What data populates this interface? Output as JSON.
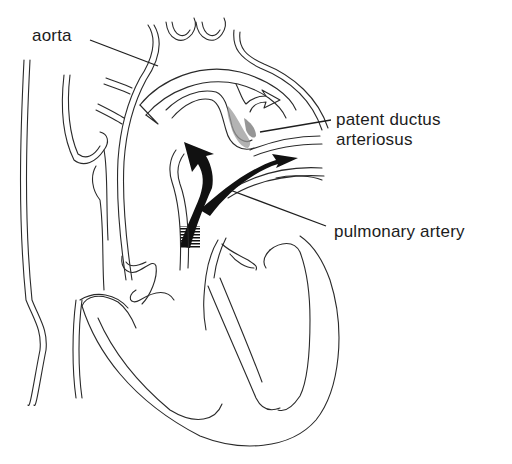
{
  "diagram": {
    "labels": {
      "aorta": "aorta",
      "pda_line1": "patent ductus",
      "pda_line2": "arteriosus",
      "pulmonary_artery": "pulmonary artery"
    },
    "colors": {
      "line": "#2a2a2a",
      "arrow_fill": "#111111",
      "shunt_shade": "#8a8a8a",
      "background": "#ffffff"
    },
    "arrows": [
      {
        "name": "aortic-flow-arrow",
        "style": "hollow",
        "direction": "right"
      },
      {
        "name": "pulmonary-flow-arrow-left",
        "style": "solid",
        "direction": "up-left"
      },
      {
        "name": "pulmonary-flow-arrow-right",
        "style": "solid",
        "direction": "right"
      }
    ]
  }
}
